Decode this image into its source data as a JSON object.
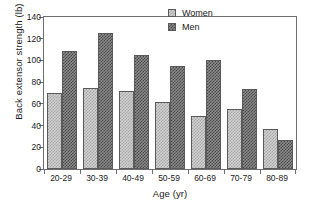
{
  "chart_data": {
    "type": "bar",
    "title": "",
    "xlabel": "Age (yr)",
    "ylabel": "Back extensor strength (lb)",
    "categories": [
      "20-29",
      "30-39",
      "40-49",
      "50-59",
      "60-69",
      "70-79",
      "80-89"
    ],
    "series": [
      {
        "name": "Women",
        "values": [
          70,
          75,
          72,
          62,
          49,
          55,
          37
        ],
        "color": "#cfcfcf"
      },
      {
        "name": "Men",
        "values": [
          109,
          125,
          105,
          95,
          100,
          74,
          27
        ],
        "color": "#8a8a8a"
      }
    ],
    "ylim": [
      0,
      140
    ],
    "yticks": [
      0,
      20,
      40,
      60,
      80,
      100,
      120,
      140
    ],
    "ytick_labels": [
      "0",
      "20",
      "40",
      "60",
      "80",
      "100",
      "120",
      "140"
    ],
    "grid": false,
    "legend_position": "top-right",
    "legend_entries": [
      "Women",
      "Men"
    ],
    "frame": "box"
  },
  "axes": {
    "y_title": "Back extensor strength (lb)",
    "x_title": "Age (yr)"
  },
  "legend": {
    "women_label": "Women",
    "men_label": "Men"
  }
}
